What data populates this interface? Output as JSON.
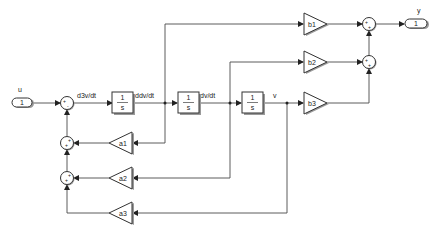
{
  "diagram": {
    "type": "simulink-block-diagram",
    "inport": {
      "number": "1",
      "label": "u"
    },
    "outport": {
      "number": "1",
      "label": "y"
    },
    "signals": {
      "s1": "d3v/dt",
      "s2": "ddv/dt",
      "s3": "dv/dt",
      "s4": "v"
    },
    "integrators": [
      {
        "num": "1",
        "den": "s"
      },
      {
        "num": "1",
        "den": "s"
      },
      {
        "num": "1",
        "den": "s"
      }
    ],
    "gains_forward": [
      "b1",
      "b2",
      "b3"
    ],
    "gains_feedback": [
      "a1",
      "a2",
      "a3"
    ],
    "sums": {
      "input_sum": {
        "signs": [
          "+",
          "-"
        ]
      },
      "feedback_sum1": {
        "signs": [
          "+",
          "+"
        ]
      },
      "feedback_sum2": {
        "signs": [
          "+",
          "+"
        ]
      },
      "output_sum1": {
        "signs": [
          "+",
          "+"
        ]
      },
      "output_sum2": {
        "signs": [
          "+",
          "+"
        ]
      }
    }
  }
}
